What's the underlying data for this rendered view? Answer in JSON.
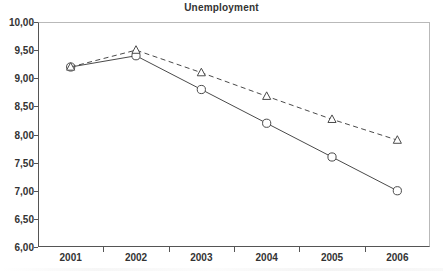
{
  "chart_data": {
    "type": "line",
    "title": "Unemployment",
    "xlabel": "",
    "ylabel": "",
    "categories": [
      "2001",
      "2002",
      "2003",
      "2004",
      "2005",
      "2006"
    ],
    "ylim": [
      6.0,
      10.0
    ],
    "ytick_labels": [
      "10,00",
      "9,50",
      "9,00",
      "8,50",
      "8,00",
      "7,50",
      "7,00",
      "6,50",
      "6,00"
    ],
    "ytick_values": [
      10.0,
      9.5,
      9.0,
      8.5,
      8.0,
      7.5,
      7.0,
      6.5,
      6.0
    ],
    "grid": false,
    "legend": "none",
    "decimal_separator": ",",
    "series": [
      {
        "name": "series-solid-circle",
        "marker": "circle-open",
        "line_style": "solid",
        "color": "#4a4a4a",
        "values": [
          9.2,
          9.4,
          8.8,
          8.2,
          7.6,
          7.0
        ]
      },
      {
        "name": "series-dashed-triangle",
        "marker": "triangle-open",
        "line_style": "dashed",
        "color": "#4a4a4a",
        "values": [
          9.2,
          9.5,
          9.1,
          8.68,
          8.27,
          7.9
        ]
      }
    ]
  },
  "style": {
    "axis_color": "#555555",
    "frame_light_color": "#b9b9b9",
    "text_color": "#333333",
    "plot_background": "#ffffff"
  }
}
